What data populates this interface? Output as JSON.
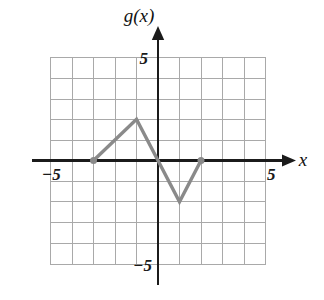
{
  "figure": {
    "kind": "coordinate-plane-graph",
    "function_label": "g(x)",
    "x_axis_label": "x",
    "background_color": "#ffffff",
    "grid_color": "#a9a9a9",
    "axis_color": "#1b1b1b",
    "curve_color": "#8a8a8a"
  },
  "labels": {
    "y_axis_name": "g(x)",
    "x_axis_name": "x",
    "y_tick_positive": "5",
    "y_tick_negative": "−5",
    "x_tick_negative": "−5",
    "x_tick_positive": "5"
  },
  "chart_data": {
    "type": "line",
    "title": "",
    "subtitle": "",
    "xlabel": "x",
    "ylabel": "g(x)",
    "xlim": [
      -5,
      5
    ],
    "ylim": [
      -5,
      5
    ],
    "xticks": [
      -5,
      5
    ],
    "yticks": [
      -5,
      5
    ],
    "xtick_labels": [
      "−5",
      "5"
    ],
    "ytick_labels": [
      "−5",
      "5"
    ],
    "grid": true,
    "grid_step": 1,
    "legend": null,
    "legend_position": "none",
    "series": [
      {
        "name": "g(x)",
        "color": "#8a8a8a",
        "x": [
          -3,
          -1,
          1,
          2
        ],
        "y": [
          0,
          2,
          -2,
          0
        ],
        "points": [
          {
            "x": -3,
            "y": 0,
            "marker": "filled-dot"
          },
          {
            "x": -1,
            "y": 2,
            "marker": "none"
          },
          {
            "x": 1,
            "y": -2,
            "marker": "none"
          },
          {
            "x": 2,
            "y": 0,
            "marker": "filled-dot"
          }
        ]
      }
    ],
    "annotations": []
  }
}
